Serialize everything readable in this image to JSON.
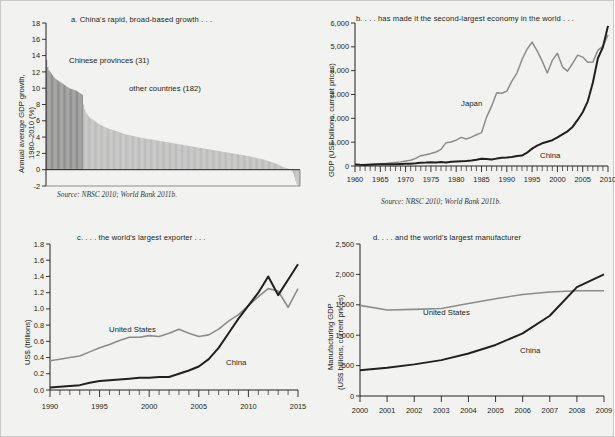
{
  "figure": {
    "background_color": "#f2f2f0",
    "series_colors": {
      "china_dark": "#231f20",
      "comparator_gray": "#8c8c8c",
      "bar_dark": "#8f8f8f",
      "bar_light": "#bdbdbd"
    }
  },
  "panels": {
    "a": {
      "title": "a. China's rapid, broad-based growth . . .",
      "source": "Source: NBSC 2010; World Bank 2011b.",
      "ylabel_line1": "Annual average GDP growth,",
      "ylabel_line2": "1980–2010 (%)",
      "label_provinces": "Chinese provinces (31)",
      "label_countries": "other countries (182)"
    },
    "b": {
      "title": "b. . . . has made it the second-largest economy in the world . . .",
      "source": "Source: NBSC 2010; World Bank 2011b.",
      "ylabel": "GDP (US$ billions, current prices)",
      "label_japan": "Japan",
      "label_china": "China"
    },
    "c": {
      "title": "c. . . . the world's largest exporter . . .",
      "ylabel": "US$ (trillions)",
      "label_us": "United States",
      "label_china": "China"
    },
    "d": {
      "title": "d. . . . and the world's largest manufacturer",
      "ylabel_line1": "Manufacturing GDP",
      "ylabel_line2": "(US$ billions, current prices)",
      "label_us": "United States",
      "label_china": "China"
    }
  },
  "chart_data": [
    {
      "panel": "a",
      "type": "bar",
      "title": "a. China's rapid, broad-based growth . . .",
      "xlabel": "",
      "ylabel": "Annual average GDP growth, 1980–2010 (%)",
      "ylim": [
        -2,
        18
      ],
      "yticks": [
        -2,
        0,
        2,
        4,
        6,
        8,
        10,
        12,
        14,
        16,
        18
      ],
      "grid": false,
      "legend": "in-plot annotations",
      "series": [
        {
          "name": "Chinese provinces (31)",
          "color": "#8f8f8f",
          "values": [
            13.5,
            12.6,
            12.2,
            12.0,
            11.8,
            11.6,
            11.4,
            11.2,
            11.1,
            11.0,
            10.9,
            10.8,
            10.7,
            10.6,
            10.5,
            10.4,
            10.3,
            10.2,
            10.1,
            10.0,
            9.95,
            9.9,
            9.85,
            9.8,
            9.75,
            9.7,
            9.6,
            9.5,
            9.4,
            9.3,
            9.2
          ]
        },
        {
          "name": "other countries (182)",
          "color": "#bdbdbd",
          "values": [
            8.0,
            7.4,
            7.0,
            6.8,
            6.6,
            6.4,
            6.3,
            6.2,
            6.1,
            6.0,
            5.9,
            5.8,
            5.7,
            5.6,
            5.5,
            5.45,
            5.4,
            5.3,
            5.2,
            5.15,
            5.1,
            5.05,
            5.0,
            4.95,
            4.9,
            4.85,
            4.8,
            4.75,
            4.7,
            4.65,
            4.6,
            4.55,
            4.5,
            4.45,
            4.4,
            4.35,
            4.3,
            4.28,
            4.25,
            4.22,
            4.2,
            4.15,
            4.12,
            4.1,
            4.05,
            4.0,
            3.98,
            3.95,
            3.92,
            3.9,
            3.88,
            3.85,
            3.82,
            3.8,
            3.78,
            3.75,
            3.72,
            3.7,
            3.68,
            3.65,
            3.62,
            3.6,
            3.58,
            3.55,
            3.52,
            3.5,
            3.48,
            3.45,
            3.42,
            3.4,
            3.38,
            3.35,
            3.32,
            3.3,
            3.28,
            3.25,
            3.22,
            3.2,
            3.18,
            3.15,
            3.12,
            3.1,
            3.08,
            3.05,
            3.02,
            3.0,
            2.98,
            2.95,
            2.92,
            2.9,
            2.88,
            2.85,
            2.82,
            2.8,
            2.78,
            2.75,
            2.72,
            2.7,
            2.68,
            2.65,
            2.62,
            2.6,
            2.58,
            2.55,
            2.52,
            2.5,
            2.48,
            2.45,
            2.42,
            2.4,
            2.38,
            2.35,
            2.32,
            2.3,
            2.28,
            2.25,
            2.22,
            2.2,
            2.18,
            2.15,
            2.12,
            2.1,
            2.08,
            2.05,
            2.02,
            2.0,
            1.98,
            1.95,
            1.92,
            1.9,
            1.88,
            1.85,
            1.82,
            1.8,
            1.78,
            1.75,
            1.72,
            1.7,
            1.68,
            1.65,
            1.6,
            1.58,
            1.55,
            1.5,
            1.48,
            1.45,
            1.4,
            1.38,
            1.35,
            1.3,
            1.28,
            1.25,
            1.2,
            1.15,
            1.1,
            1.05,
            1.0,
            0.95,
            0.9,
            0.85,
            0.8,
            0.75,
            0.7,
            0.62,
            0.55,
            0.48,
            0.4,
            0.35,
            0.3,
            0.25,
            0.2,
            0.15,
            0.1,
            0.05,
            0.0,
            -0.2,
            -0.5,
            -0.9,
            -1.4,
            -1.8,
            -2.0,
            -2.0
          ]
        }
      ]
    },
    {
      "panel": "b",
      "type": "line",
      "title": "b. . . . has made it the second-largest economy in the world . . .",
      "xlabel": "",
      "ylabel": "GDP (US$ billions, current prices)",
      "xlim": [
        1960,
        2010
      ],
      "ylim": [
        0,
        6000
      ],
      "yticks": [
        0,
        1000,
        2000,
        3000,
        4000,
        5000,
        6000
      ],
      "ytick_labels": [
        "0",
        "1,000",
        "2,000",
        "3,000",
        "4,000",
        "5,000",
        "6,000"
      ],
      "xticks": [
        1960,
        1965,
        1970,
        1975,
        1980,
        1985,
        1990,
        1995,
        2000,
        2005,
        2010
      ],
      "minor_xticks_every": 1,
      "grid": false,
      "legend": "in-plot annotations",
      "series": [
        {
          "name": "Japan",
          "color": "#8c8c8c",
          "x": [
            1960,
            1961,
            1962,
            1963,
            1964,
            1965,
            1966,
            1967,
            1968,
            1969,
            1970,
            1971,
            1972,
            1973,
            1974,
            1975,
            1976,
            1977,
            1978,
            1979,
            1980,
            1981,
            1982,
            1983,
            1984,
            1985,
            1986,
            1987,
            1988,
            1989,
            1990,
            1991,
            1992,
            1993,
            1994,
            1995,
            1996,
            1997,
            1998,
            1999,
            2000,
            2001,
            2002,
            2003,
            2004,
            2005,
            2006,
            2007,
            2008,
            2009,
            2010
          ],
          "values": [
            44,
            54,
            61,
            70,
            82,
            91,
            106,
            124,
            147,
            173,
            213,
            240,
            318,
            432,
            475,
            521,
            586,
            697,
            980,
            1010,
            1087,
            1200,
            1135,
            1213,
            1310,
            1399,
            2050,
            2510,
            3070,
            3055,
            3140,
            3560,
            3900,
            4460,
            4900,
            5200,
            4830,
            4400,
            3900,
            4430,
            4730,
            4160,
            3980,
            4300,
            4650,
            4570,
            4350,
            4360,
            4850,
            5030,
            5500
          ]
        },
        {
          "name": "China",
          "color": "#231f20",
          "x": [
            1960,
            1961,
            1962,
            1963,
            1964,
            1965,
            1966,
            1967,
            1968,
            1969,
            1970,
            1971,
            1972,
            1973,
            1974,
            1975,
            1976,
            1977,
            1978,
            1979,
            1980,
            1981,
            1982,
            1983,
            1984,
            1985,
            1986,
            1987,
            1988,
            1989,
            1990,
            1991,
            1992,
            1993,
            1994,
            1995,
            1996,
            1997,
            1998,
            1999,
            2000,
            2001,
            2002,
            2003,
            2004,
            2005,
            2006,
            2007,
            2008,
            2009,
            2010
          ],
          "values": [
            60,
            50,
            47,
            51,
            59,
            70,
            76,
            72,
            70,
            79,
            92,
            99,
            113,
            137,
            142,
            161,
            152,
            172,
            148,
            177,
            189,
            195,
            205,
            229,
            259,
            307,
            298,
            271,
            310,
            344,
            357,
            379,
            422,
            440,
            559,
            728,
            856,
            953,
            1019,
            1083,
            1198,
            1325,
            1454,
            1641,
            1932,
            2257,
            2713,
            3494,
            4522,
            4991,
            5879
          ]
        }
      ]
    },
    {
      "panel": "c",
      "type": "line",
      "title": "c. . . . the world's largest exporter . . .",
      "xlabel": "",
      "ylabel": "US$ (trillions)",
      "xlim": [
        1990,
        2015
      ],
      "ylim": [
        0.0,
        1.8
      ],
      "yticks": [
        0.0,
        0.2,
        0.4,
        0.6,
        0.8,
        1.0,
        1.2,
        1.4,
        1.6,
        1.8
      ],
      "ytick_labels": [
        "0.0",
        "0.2",
        "0.4",
        "0.6",
        "0.8",
        "1.0",
        "1.2",
        "1.4",
        "1.6",
        "1.8"
      ],
      "xticks": [
        1990,
        1995,
        2000,
        2005,
        2010,
        2015
      ],
      "minor_xticks_every": 1,
      "grid": false,
      "legend": "in-plot annotations",
      "series": [
        {
          "name": "United States",
          "color": "#8c8c8c",
          "x": [
            1990,
            1991,
            1992,
            1993,
            1994,
            1995,
            1996,
            1997,
            1998,
            1999,
            2000,
            2001,
            2002,
            2003,
            2004,
            2005,
            2006,
            2007,
            2008,
            2009,
            2010,
            2011,
            2012,
            2013,
            2014,
            2015
          ],
          "values": [
            0.36,
            0.38,
            0.4,
            0.42,
            0.47,
            0.52,
            0.56,
            0.61,
            0.65,
            0.65,
            0.67,
            0.66,
            0.7,
            0.75,
            0.7,
            0.66,
            0.68,
            0.75,
            0.85,
            0.93,
            1.04,
            1.15,
            1.25,
            1.22,
            1.02,
            1.25
          ]
        },
        {
          "name": "China",
          "color": "#231f20",
          "x": [
            1990,
            1991,
            1992,
            1993,
            1994,
            1995,
            1996,
            1997,
            1998,
            1999,
            2000,
            2001,
            2002,
            2003,
            2004,
            2005,
            2006,
            2007,
            2008,
            2009,
            2010,
            2011,
            2012,
            2013,
            2014,
            2015
          ],
          "values": [
            0.03,
            0.04,
            0.05,
            0.06,
            0.09,
            0.11,
            0.12,
            0.13,
            0.14,
            0.15,
            0.15,
            0.16,
            0.16,
            0.2,
            0.24,
            0.29,
            0.38,
            0.52,
            0.7,
            0.88,
            1.04,
            1.2,
            1.4,
            1.17,
            1.36,
            1.55
          ]
        }
      ]
    },
    {
      "panel": "d",
      "type": "line",
      "title": "d. . . . and the world's largest manufacturer",
      "xlabel": "",
      "ylabel": "Manufacturing GDP (US$ billions, current prices)",
      "xlim": [
        2000,
        2009
      ],
      "ylim": [
        0,
        2500
      ],
      "yticks": [
        0,
        500,
        1000,
        1500,
        2000,
        2500
      ],
      "ytick_labels": [
        "0",
        "500",
        "1,000",
        "1,500",
        "2,000",
        "2,500"
      ],
      "xticks": [
        2000,
        2001,
        2002,
        2003,
        2004,
        2005,
        2006,
        2007,
        2008,
        2009
      ],
      "grid": false,
      "legend": "in-plot annotations",
      "series": [
        {
          "name": "United States",
          "color": "#8c8c8c",
          "x": [
            2000,
            2001,
            2002,
            2003,
            2004,
            2005,
            2006,
            2007,
            2008,
            2009
          ],
          "values": [
            1490,
            1415,
            1425,
            1440,
            1520,
            1600,
            1670,
            1710,
            1730,
            1730
          ]
        },
        {
          "name": "China",
          "color": "#231f20",
          "x": [
            2000,
            2001,
            2002,
            2003,
            2004,
            2005,
            2006,
            2007,
            2008,
            2009
          ],
          "values": [
            425,
            465,
            520,
            590,
            700,
            840,
            1030,
            1320,
            1790,
            2000
          ]
        }
      ]
    }
  ]
}
